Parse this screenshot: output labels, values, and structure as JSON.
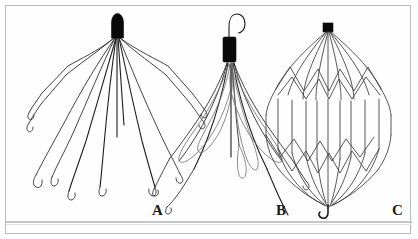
{
  "figure": {
    "background_color": "#ffffff",
    "frame_color": "#b9bcbd",
    "ink_color": "#2b2b2b",
    "cap_color": "#0a0a0a",
    "panels": [
      {
        "id": "A",
        "label": "A",
        "device_name": "conical-multi-leg-filter",
        "cap_shape": "rounded-capsule",
        "cap_color": "#0a0a0a",
        "leg_count": 12,
        "leg_tip": "j-hook",
        "apex_hook": false,
        "description": "Conical filter with rounded black apex cap and twelve long splayed legs ending in small J hooks"
      },
      {
        "id": "B",
        "label": "B",
        "device_name": "tulip-loop-filter",
        "cap_shape": "rectangular-sleeve",
        "cap_color": "#0a0a0a",
        "leg_count": 12,
        "leg_tip": "curved",
        "apex_hook": true,
        "description": "Tulip shaped filter with retrieval hook above a black rectangular sleeve, bowed loop petals and long trailing legs"
      },
      {
        "id": "C",
        "label": "C",
        "device_name": "birdcage-strut-filter",
        "cap_shape": "square-block",
        "cap_color": "#0a0a0a",
        "leg_count": 12,
        "leg_tip": "converging",
        "apex_hook": false,
        "basal_hook": true,
        "description": "Closed birdcage filter with square black apex block, vertical struts, zigzag cross bracing and a basal retrieval hook"
      }
    ]
  }
}
